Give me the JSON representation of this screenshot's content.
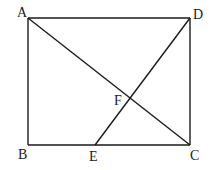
{
  "figure": {
    "type": "geometry",
    "points": {
      "A": {
        "x": 28,
        "y": 18,
        "label": "A"
      },
      "B": {
        "x": 28,
        "y": 145,
        "label": "B"
      },
      "C": {
        "x": 190,
        "y": 145,
        "label": "C"
      },
      "D": {
        "x": 190,
        "y": 18,
        "label": "D"
      },
      "E": {
        "x": 95,
        "y": 145,
        "label": "E"
      },
      "F": {
        "x": 129,
        "y": 98,
        "label": "F"
      }
    },
    "segments": [
      [
        "A",
        "D"
      ],
      [
        "D",
        "C"
      ],
      [
        "C",
        "B"
      ],
      [
        "B",
        "A"
      ],
      [
        "A",
        "C"
      ],
      [
        "D",
        "E"
      ]
    ],
    "line_color": "#1a1a1a"
  }
}
